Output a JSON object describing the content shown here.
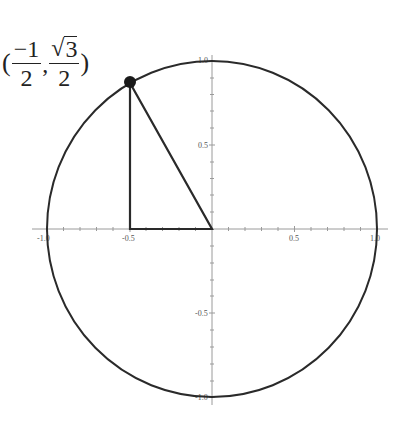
{
  "diagram": {
    "type": "unit-circle",
    "center": {
      "x": 0,
      "y": 0
    },
    "radius": 1,
    "point": {
      "x": -0.5,
      "y": 0.866,
      "label_open": "(",
      "label_x_num": "−1",
      "label_x_den": "2",
      "label_sep": ",",
      "label_y_sqrt": "√",
      "label_y_radicand": "3",
      "label_y_den": "2",
      "label_close": ")"
    },
    "triangle": [
      [
        -0.5,
        0.866
      ],
      [
        -0.5,
        0
      ],
      [
        0,
        0
      ]
    ],
    "x_ticks": [
      {
        "value": -1.0,
        "label": "-1.0"
      },
      {
        "value": -0.5,
        "label": "-0.5"
      },
      {
        "value": 0.5,
        "label": "0.5"
      },
      {
        "value": 1.0,
        "label": "1.0"
      }
    ],
    "y_ticks": [
      {
        "value": 1.0,
        "label": "1.0"
      },
      {
        "value": 0.5,
        "label": "0.5"
      },
      {
        "value": -0.5,
        "label": "-0.5"
      },
      {
        "value": -1.0,
        "label": "-1.0"
      }
    ],
    "colors": {
      "stroke": "#2a2a2a",
      "axis": "#999999",
      "point": "#1a1a1a"
    }
  }
}
